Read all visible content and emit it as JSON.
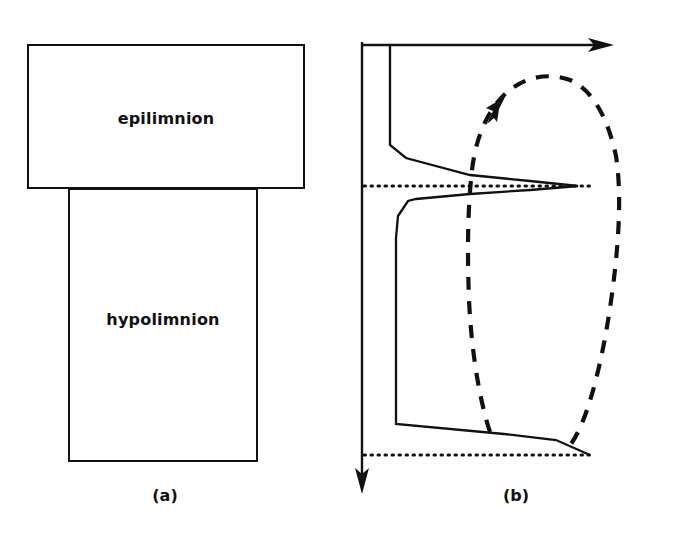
{
  "figure": {
    "panels": [
      {
        "id": "a",
        "caption": "(a)",
        "layers": [
          {
            "name": "epilimnion",
            "label": "epilimnion"
          },
          {
            "name": "hypolimnion",
            "label": "hypolimnion"
          }
        ]
      },
      {
        "id": "b",
        "caption": "(b)",
        "axes": {
          "horizontal_axis_name": "concentration-axis",
          "vertical_axis_name": "depth-axis",
          "horizontal_arrow": "right-arrow",
          "vertical_arrow": "down-arrow"
        },
        "boundaries": [
          {
            "name": "thermocline-boundary",
            "style": "dotted"
          },
          {
            "name": "sediment-boundary",
            "style": "dotted"
          }
        ],
        "curves": [
          {
            "name": "solid-profile-curve",
            "style": "solid"
          },
          {
            "name": "dashed-profile-curve",
            "style": "dashed"
          }
        ],
        "annotations": [
          {
            "name": "flow-direction-arrow",
            "style": "solid-arrowhead"
          }
        ]
      }
    ]
  },
  "colors": {
    "ink": "#111111",
    "paper": "#ffffff"
  },
  "chart_data": {
    "type": "line",
    "title": "",
    "xlabel": "",
    "ylabel": "",
    "xlim": [
      0,
      338
    ],
    "ylim": [
      546,
      0
    ],
    "grid": false,
    "legend": "none",
    "axis_origin": [
      362,
      45
    ],
    "horizontal_axis_end": [
      612,
      45
    ],
    "vertical_axis_end": [
      362,
      492
    ],
    "boundary_lines": [
      {
        "name": "thermocline",
        "y": 186,
        "x_start": 362,
        "x_end": 592
      },
      {
        "name": "bottom",
        "y": 455,
        "x_start": 362,
        "x_end": 592
      }
    ],
    "series": [
      {
        "name": "solid-profile",
        "style": "solid",
        "points": [
          [
            390,
            46
          ],
          [
            390,
            145
          ],
          [
            406,
            158
          ],
          [
            470,
            175
          ],
          [
            530,
            181
          ],
          [
            578,
            186
          ],
          [
            530,
            190
          ],
          [
            470,
            194
          ],
          [
            416,
            199
          ],
          [
            408,
            201
          ],
          [
            398,
            216
          ],
          [
            396,
            238
          ],
          [
            396,
            424
          ],
          [
            504,
            434
          ],
          [
            556,
            440
          ],
          [
            590,
            455
          ]
        ]
      },
      {
        "name": "dashed-profile",
        "style": "dashed",
        "points": [
          [
            490,
            432
          ],
          [
            478,
            392
          ],
          [
            470,
            320
          ],
          [
            468,
            246
          ],
          [
            470,
            190
          ],
          [
            474,
            148
          ],
          [
            486,
            116
          ],
          [
            502,
            96
          ],
          [
            520,
            82
          ],
          [
            545,
            75
          ],
          [
            570,
            80
          ],
          [
            592,
            98
          ],
          [
            608,
            124
          ],
          [
            617,
            158
          ],
          [
            619,
            196
          ],
          [
            614,
            260
          ],
          [
            604,
            330
          ],
          [
            592,
            392
          ],
          [
            580,
            428
          ],
          [
            566,
            448
          ]
        ]
      }
    ],
    "annotations": [
      {
        "name": "flow-arrow",
        "tip": [
          503,
          100
        ],
        "tail": [
          487,
          124
        ],
        "direction": "up-right"
      }
    ]
  }
}
